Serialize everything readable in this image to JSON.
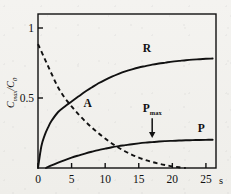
{
  "figure": {
    "background_color": "#f2f1ee",
    "line_color": "#111111",
    "frame": {
      "left": 38,
      "right": 216,
      "top": 14,
      "bottom": 168
    }
  },
  "axes": {
    "y_label_main": "C",
    "y_label_sub1": "max",
    "y_label_slash": "/C",
    "y_label_sub2": "0",
    "y_ticks": [
      {
        "value": 1,
        "label": "1"
      },
      {
        "value": 0.5,
        "label": "0.5"
      }
    ],
    "y_range": [
      0,
      1.1
    ],
    "x_ticks": [
      {
        "value": 0,
        "label": "0"
      },
      {
        "value": 5,
        "label": "5"
      },
      {
        "value": 10,
        "label": "10"
      },
      {
        "value": 15,
        "label": "15"
      },
      {
        "value": 20,
        "label": "20"
      },
      {
        "value": 25,
        "label": "25"
      }
    ],
    "x_range": [
      0,
      26.5
    ],
    "x_unit_label": "s"
  },
  "annotations": {
    "label_R": "R",
    "label_A": "A",
    "label_P": "P",
    "label_Pmax_main": "P",
    "label_Pmax_sub": "max"
  },
  "chart_data": {
    "type": "line",
    "title": "",
    "xlabel": "s",
    "ylabel": "Cmax/C0",
    "xlim": [
      0,
      26.5
    ],
    "ylim": [
      0,
      1.1
    ],
    "grid": false,
    "legend": "inline-curve-labels",
    "series": [
      {
        "name": "R",
        "style": "solid",
        "label_position": {
          "x": 16.2,
          "y": 0.83
        },
        "x": [
          0,
          0.5,
          1,
          1.5,
          2,
          3,
          4,
          5,
          6,
          7,
          8,
          9,
          10,
          11,
          12,
          13,
          14,
          15,
          16,
          17,
          18,
          19,
          20,
          21,
          22,
          23,
          24,
          25,
          26
        ],
        "y": [
          0.0,
          0.155,
          0.235,
          0.29,
          0.335,
          0.4,
          0.44,
          0.475,
          0.51,
          0.545,
          0.575,
          0.605,
          0.63,
          0.652,
          0.672,
          0.69,
          0.705,
          0.718,
          0.728,
          0.738,
          0.746,
          0.753,
          0.76,
          0.765,
          0.77,
          0.774,
          0.777,
          0.78,
          0.782
        ]
      },
      {
        "name": "A",
        "style": "dashed",
        "label_position": {
          "x": 7.4,
          "y": 0.435
        },
        "x": [
          0,
          1,
          2,
          3,
          4,
          5,
          6,
          7,
          8,
          9,
          10,
          11,
          12,
          13,
          14,
          15,
          16,
          17,
          18,
          19,
          20,
          21,
          22
        ],
        "y": [
          0.885,
          0.78,
          0.675,
          0.575,
          0.5,
          0.44,
          0.385,
          0.335,
          0.29,
          0.248,
          0.21,
          0.175,
          0.145,
          0.118,
          0.094,
          0.074,
          0.057,
          0.043,
          0.031,
          0.021,
          0.012,
          0.005,
          0.0
        ]
      },
      {
        "name": "P",
        "style": "solid",
        "label_position": {
          "x": 24.3,
          "y": 0.255
        },
        "x": [
          1.2,
          2,
          3,
          4,
          5,
          6,
          7,
          8,
          9,
          10,
          11,
          12,
          13,
          14,
          15,
          16,
          17,
          18,
          19,
          20,
          21,
          22,
          23,
          24,
          25,
          26
        ],
        "y": [
          0.0,
          0.018,
          0.038,
          0.057,
          0.074,
          0.089,
          0.103,
          0.116,
          0.128,
          0.138,
          0.148,
          0.156,
          0.163,
          0.17,
          0.176,
          0.181,
          0.185,
          0.189,
          0.192,
          0.194,
          0.196,
          0.198,
          0.199,
          0.2,
          0.201,
          0.202
        ]
      }
    ],
    "markers": [
      {
        "name": "Pmax",
        "type": "down-arrow-annotation",
        "x": 17.0,
        "label_y": 0.4,
        "arrow_from_y": 0.355,
        "arrow_to_y": 0.215
      }
    ]
  }
}
